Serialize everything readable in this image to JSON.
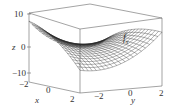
{
  "chart_data": {
    "type": "surface3d",
    "title": "",
    "surface_label": "f_x",
    "xlabel": "x",
    "ylabel": "y",
    "zlabel": "z",
    "x_ticks": [
      "-2",
      "0",
      "2"
    ],
    "y_ticks": [
      "-2",
      "0",
      "2"
    ],
    "z_ticks": [
      "10",
      "0",
      "-10"
    ],
    "xlim": [
      -2,
      2
    ],
    "ylim": [
      -2,
      2
    ],
    "zlim": [
      -12,
      10
    ],
    "grid": false,
    "mesh": "wireframe"
  },
  "labels": {
    "z_axis": "z",
    "z_tick_top": "10",
    "z_tick_mid": "0",
    "z_tick_bot": "−10",
    "x_axis": "x",
    "x_tick_left": "−2",
    "x_tick_mid": "0",
    "x_tick_right": "2",
    "y_axis": "y",
    "y_tick_left": "−2",
    "y_tick_mid": "0",
    "y_tick_right": "2",
    "surface_f": "f",
    "surface_sub": "x"
  },
  "colors": {
    "box": "#555555",
    "mesh": "#222222",
    "text": "#333333"
  }
}
